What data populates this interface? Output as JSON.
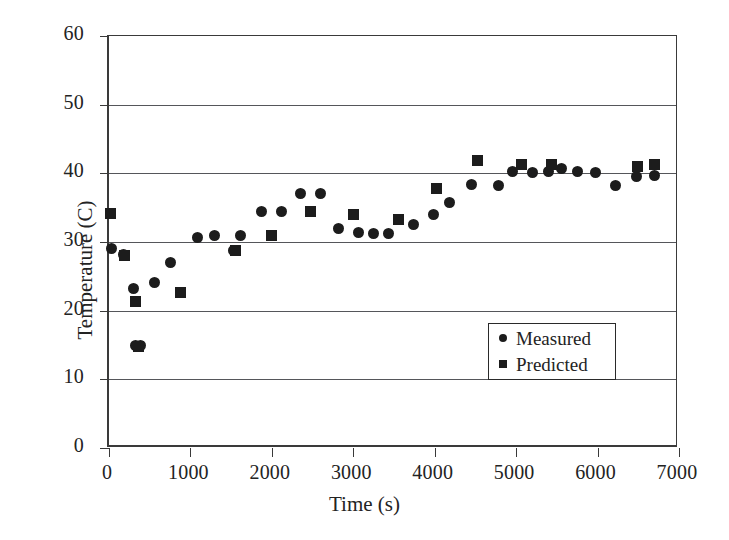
{
  "chart_data": {
    "type": "scatter",
    "title": "",
    "xlabel": "Time (s)",
    "ylabel": "Temperature (C)",
    "xlim": [
      0,
      7000
    ],
    "ylim": [
      0,
      60
    ],
    "xticks": [
      0,
      1000,
      2000,
      3000,
      4000,
      5000,
      6000,
      7000
    ],
    "yticks": [
      0,
      10,
      20,
      30,
      40,
      50,
      60
    ],
    "grid": "horizontal",
    "legend_position": "lower-right-inside",
    "marker_color": "#1c1c1c",
    "series": [
      {
        "name": "Measured",
        "marker": "circle",
        "points": [
          [
            30,
            29.0
          ],
          [
            180,
            28.2
          ],
          [
            300,
            23.2
          ],
          [
            330,
            15.0
          ],
          [
            390,
            15.0
          ],
          [
            560,
            24.1
          ],
          [
            760,
            27.0
          ],
          [
            1090,
            30.6
          ],
          [
            1300,
            31.0
          ],
          [
            1530,
            28.8
          ],
          [
            1620,
            31.0
          ],
          [
            1870,
            34.4
          ],
          [
            2120,
            34.5
          ],
          [
            2350,
            37.0
          ],
          [
            2600,
            37.0
          ],
          [
            2820,
            32.0
          ],
          [
            3060,
            31.4
          ],
          [
            3250,
            31.2
          ],
          [
            3430,
            31.2
          ],
          [
            3740,
            32.5
          ],
          [
            3980,
            34.0
          ],
          [
            4180,
            35.8
          ],
          [
            4450,
            38.4
          ],
          [
            4780,
            38.3
          ],
          [
            4950,
            40.2
          ],
          [
            5200,
            40.1
          ],
          [
            5400,
            40.2
          ],
          [
            5560,
            40.7
          ],
          [
            5750,
            40.2
          ],
          [
            5980,
            40.1
          ],
          [
            6220,
            38.2
          ],
          [
            6480,
            39.6
          ],
          [
            6700,
            39.7
          ]
        ]
      },
      {
        "name": "Predicted",
        "marker": "square",
        "points": [
          [
            20,
            34.2
          ],
          [
            190,
            28.0
          ],
          [
            320,
            21.4
          ],
          [
            360,
            14.8
          ],
          [
            880,
            22.7
          ],
          [
            1550,
            28.7
          ],
          [
            2000,
            31.0
          ],
          [
            2470,
            34.5
          ],
          [
            3000,
            34.0
          ],
          [
            3560,
            33.3
          ],
          [
            4020,
            37.8
          ],
          [
            4530,
            41.8
          ],
          [
            5060,
            41.3
          ],
          [
            5430,
            41.3
          ],
          [
            6490,
            41.0
          ],
          [
            6700,
            41.3
          ]
        ]
      }
    ]
  },
  "axis": {
    "y_title": "Temperature (C)",
    "x_title": "Time (s)"
  },
  "legend": {
    "items": [
      {
        "label": "Measured",
        "marker": "circle-marker"
      },
      {
        "label": "Predicted",
        "marker": "square-marker"
      }
    ]
  }
}
